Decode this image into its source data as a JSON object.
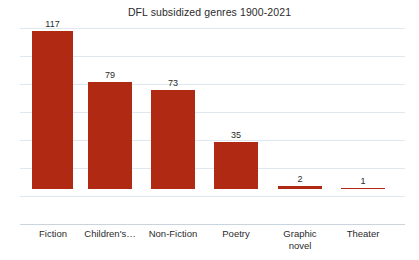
{
  "chart_data": {
    "type": "bar",
    "title": "DFL subsidized genres 1900-2021",
    "xlabel": "",
    "ylabel": "",
    "categories": [
      "Fiction",
      "Children's…",
      "Non-Fiction",
      "Poetry",
      "Graphic\nnovel",
      "Theater"
    ],
    "values": [
      117,
      79,
      73,
      35,
      2,
      1
    ],
    "value_labels": [
      "117",
      "79",
      "73",
      "35",
      "2",
      "1"
    ],
    "ylim": [
      0,
      140
    ],
    "gridlines": [
      140,
      120,
      100,
      80,
      60,
      40,
      20
    ],
    "grid": true,
    "legend": "none",
    "bar_color": "#b02a13",
    "grid_color": "#dfe8f0",
    "axis_color": "#c9d4de",
    "background": "#ffffff",
    "text_color": "#2b2b2b"
  }
}
